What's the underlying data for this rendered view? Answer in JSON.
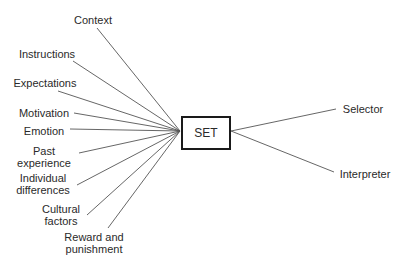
{
  "diagram": {
    "center": {
      "label": "SET",
      "box": {
        "x": 181,
        "y": 116,
        "w": 50,
        "h": 34
      }
    },
    "inputs": [
      {
        "id": "context",
        "lines": [
          "Context"
        ],
        "box": {
          "x": 70,
          "y": 14,
          "w": 46
        },
        "from": [
          97,
          28
        ]
      },
      {
        "id": "instructions",
        "lines": [
          "Instructions"
        ],
        "box": {
          "x": 16,
          "y": 48,
          "w": 62
        },
        "from": [
          73,
          61
        ]
      },
      {
        "id": "expectations",
        "lines": [
          "Expectations"
        ],
        "box": {
          "x": 12,
          "y": 77,
          "w": 66
        },
        "from": [
          58,
          91
        ]
      },
      {
        "id": "motivation",
        "lines": [
          "Motivation"
        ],
        "box": {
          "x": 18,
          "y": 107,
          "w": 52
        },
        "from": [
          74,
          113
        ]
      },
      {
        "id": "emotion",
        "lines": [
          "Emotion"
        ],
        "box": {
          "x": 22,
          "y": 125,
          "w": 44
        },
        "from": [
          70,
          129
        ]
      },
      {
        "id": "past-experience",
        "lines": [
          "Past",
          "experience"
        ],
        "box": {
          "x": 16,
          "y": 145,
          "w": 56
        },
        "from": [
          79,
          153
        ]
      },
      {
        "id": "individual-differences",
        "lines": [
          "Individual",
          "differences"
        ],
        "box": {
          "x": 14,
          "y": 172,
          "w": 58
        },
        "from": [
          77,
          185
        ]
      },
      {
        "id": "cultural-factors",
        "lines": [
          "Cultural",
          "factors"
        ],
        "box": {
          "x": 40,
          "y": 203,
          "w": 42
        },
        "from": [
          87,
          215
        ]
      },
      {
        "id": "reward-punishment",
        "lines": [
          "Reward and",
          "punishment"
        ],
        "box": {
          "x": 63,
          "y": 231,
          "w": 62
        },
        "from": [
          108,
          228
        ]
      }
    ],
    "outputs": [
      {
        "id": "selector",
        "lines": [
          "Selector"
        ],
        "box": {
          "x": 340,
          "y": 103,
          "w": 46
        },
        "to": [
          336,
          109
        ]
      },
      {
        "id": "interpreter",
        "lines": [
          "Interpreter"
        ],
        "box": {
          "x": 338,
          "y": 168,
          "w": 54
        },
        "to": [
          334,
          172
        ]
      }
    ],
    "convergence_in": [
      180,
      131
    ],
    "convergence_out": [
      231,
      131
    ],
    "line_color": "#555555",
    "box_border_color": "#1a1a1a"
  }
}
